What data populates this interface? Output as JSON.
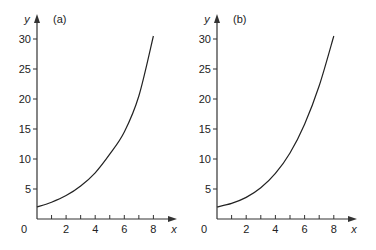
{
  "chart_data": [
    {
      "type": "line",
      "panel_label": "(a)",
      "xlabel": "x",
      "ylabel": "y",
      "xlim": [
        0,
        9
      ],
      "ylim": [
        0,
        31
      ],
      "x_ticks": [
        1,
        2,
        3,
        4,
        5,
        6,
        7,
        8
      ],
      "x_tick_labels": [
        "",
        "2",
        "",
        "4",
        "",
        "6",
        "",
        "8"
      ],
      "y_ticks": [
        0,
        5,
        10,
        15,
        20,
        25,
        30
      ],
      "y_tick_labels": [
        "0",
        "5",
        "10",
        "15",
        "20",
        "25",
        "30"
      ],
      "grid": false,
      "series": [
        {
          "name": "curve (a)",
          "x": [
            0,
            1,
            2,
            3,
            4,
            5,
            6,
            7,
            8
          ],
          "y": [
            2.0,
            2.8,
            3.9,
            5.5,
            7.7,
            10.8,
            14.5,
            20.5,
            30.5
          ]
        }
      ]
    },
    {
      "type": "line",
      "panel_label": "(b)",
      "xlabel": "x",
      "ylabel": "y",
      "xlim": [
        0,
        9
      ],
      "ylim": [
        0,
        31
      ],
      "x_ticks": [
        1,
        2,
        3,
        4,
        5,
        6,
        7,
        8
      ],
      "x_tick_labels": [
        "",
        "2",
        "",
        "4",
        "",
        "6",
        "",
        "8"
      ],
      "y_ticks": [
        0,
        5,
        10,
        15,
        20,
        25,
        30
      ],
      "y_tick_labels": [
        "0",
        "5",
        "10",
        "15",
        "20",
        "25",
        "30"
      ],
      "grid": false,
      "series": [
        {
          "name": "curve (b)",
          "x": [
            0,
            1,
            2,
            3,
            4,
            5,
            6,
            7,
            8
          ],
          "y": [
            2.0,
            2.6,
            3.6,
            5.2,
            7.6,
            11.0,
            15.8,
            22.2,
            30.5
          ]
        }
      ]
    }
  ],
  "panels": [
    {
      "label": "(a)",
      "xlabel": "x",
      "ylabel": "y"
    },
    {
      "label": "(b)",
      "xlabel": "x",
      "ylabel": "y"
    }
  ]
}
